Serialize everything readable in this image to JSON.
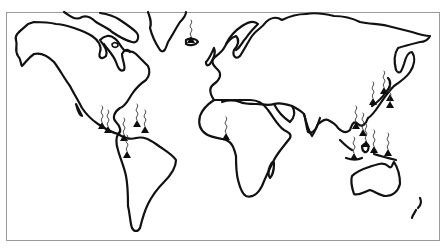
{
  "map": {
    "type": "world-outline",
    "style": "black-and-white line art",
    "marker_meaning": "active volcano (triangle with smoke plume)",
    "colors": {
      "background": "#ffffff",
      "coastline": "#111111",
      "frame": "#9a9a9a",
      "marker": "#0d0d0d"
    },
    "volcano_regions": [
      {
        "region": "Iceland",
        "count": 1
      },
      {
        "region": "Central America / Mexico",
        "count": 4
      },
      {
        "region": "Caribbean",
        "count": 2
      },
      {
        "region": "Northern Andes (Colombia/Ecuador)",
        "count": 1
      },
      {
        "region": "Cameroon (West Africa)",
        "count": 1
      },
      {
        "region": "Kamchatka / Kuril Islands",
        "count": 2
      },
      {
        "region": "Japan",
        "count": 2
      },
      {
        "region": "Philippines",
        "count": 2
      },
      {
        "region": "Indonesia",
        "count": 4
      },
      {
        "region": "Papua New Guinea",
        "count": 1
      }
    ],
    "volcanoes": [
      {
        "id": "iceland",
        "x": 191,
        "y": 41,
        "smoke": true
      },
      {
        "id": "mexico-1",
        "x": 102,
        "y": 127,
        "smoke": true
      },
      {
        "id": "mexico-2",
        "x": 108,
        "y": 131,
        "smoke": true
      },
      {
        "id": "guatemala",
        "x": 124,
        "y": 139,
        "smoke": true
      },
      {
        "id": "caribbean-1",
        "x": 137,
        "y": 125,
        "smoke": true
      },
      {
        "id": "caribbean-2",
        "x": 145,
        "y": 131,
        "smoke": true
      },
      {
        "id": "colombia",
        "x": 127,
        "y": 156,
        "smoke": true
      },
      {
        "id": "cameroon",
        "x": 226,
        "y": 138,
        "smoke": true
      },
      {
        "id": "kamchatka",
        "x": 384,
        "y": 92,
        "smoke": true
      },
      {
        "id": "kuril",
        "x": 390,
        "y": 99,
        "smoke": false
      },
      {
        "id": "japan-1",
        "x": 373,
        "y": 103,
        "smoke": true
      },
      {
        "id": "japan-2",
        "x": 390,
        "y": 106,
        "smoke": true
      },
      {
        "id": "philippines-1",
        "x": 356,
        "y": 127,
        "smoke": true
      },
      {
        "id": "philippines-2",
        "x": 363,
        "y": 134,
        "smoke": true
      },
      {
        "id": "indonesia-1",
        "x": 366,
        "y": 145,
        "smoke": true
      },
      {
        "id": "indonesia-2",
        "x": 374,
        "y": 151,
        "smoke": true
      },
      {
        "id": "indonesia-3",
        "x": 354,
        "y": 158,
        "smoke": true
      },
      {
        "id": "papua",
        "x": 388,
        "y": 154,
        "smoke": true
      }
    ]
  }
}
